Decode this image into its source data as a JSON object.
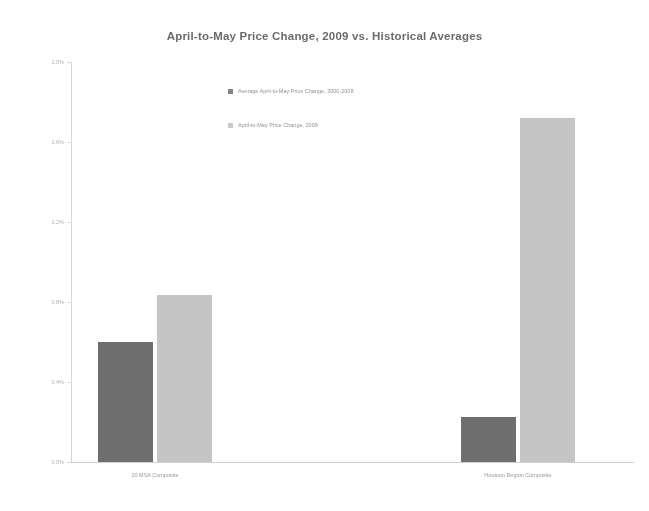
{
  "chart_data": {
    "type": "bar",
    "title": "April-to-May Price Change, 2009 vs. Historical Averages",
    "xlabel": "",
    "ylabel": "",
    "categories": [
      "20 MSA Composite",
      "Houston Region Composite"
    ],
    "series": [
      {
        "name": "Average April-to-May Price Change, 2000-2008",
        "color": "#6e6e6e",
        "values": [
          0.6,
          0.225
        ]
      },
      {
        "name": "April-to-May Price Change, 2009",
        "color": "#c5c5c5",
        "values": [
          0.835,
          1.72
        ]
      }
    ],
    "ylim": [
      0.0,
      2.0
    ],
    "yticks": [
      {
        "value": 2.0,
        "label": "2.0%"
      },
      {
        "value": 1.6,
        "label": "1.6%"
      },
      {
        "value": 1.2,
        "label": "1.2%"
      },
      {
        "value": 0.8,
        "label": "0.8%"
      },
      {
        "value": 0.4,
        "label": "0.4%"
      },
      {
        "value": 0.0,
        "label": "0.0%"
      }
    ],
    "grid": false,
    "legend_position": "upper-center"
  },
  "legend": {
    "items": [
      {
        "label": "Average April-to-May Price Change, 2000-2008",
        "swatch": "avg"
      },
      {
        "label": "April-to-May Price Change, 2009",
        "swatch": "y2009"
      }
    ]
  },
  "colors": {
    "bar_average": "#6e6e6e",
    "bar_2009": "#c5c5c5",
    "axis": "#c6c6c6",
    "text": "#6c6c6c",
    "background": "#ffffff"
  }
}
